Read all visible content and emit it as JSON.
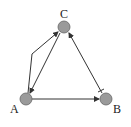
{
  "diagram": {
    "type": "directed-graph",
    "nodes": [
      {
        "id": "C",
        "label": "C",
        "x": 64,
        "y": 27
      },
      {
        "id": "A",
        "label": "A",
        "x": 26,
        "y": 99
      },
      {
        "id": "B",
        "label": "B",
        "x": 106,
        "y": 99
      }
    ],
    "edges": [
      {
        "from": "A",
        "to": "C",
        "type": "activation",
        "routed": true
      },
      {
        "from": "C",
        "to": "A",
        "type": "activation"
      },
      {
        "from": "A",
        "to": "B",
        "type": "activation"
      },
      {
        "from": "B",
        "to": "C",
        "type": "activation-with-inhibition-bar-at-source"
      }
    ],
    "colors": {
      "node_fill": "#9a9a9a",
      "node_stroke": "#666666",
      "edge": "#333333"
    }
  }
}
